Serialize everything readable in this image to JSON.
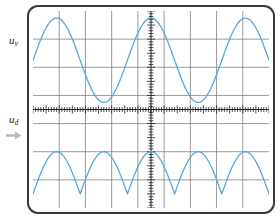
{
  "figure": {
    "kind": "oscilloscope-display"
  },
  "labels": {
    "channel_top": {
      "symbol": "u",
      "subscript": "v"
    },
    "channel_bottom": {
      "symbol": "u",
      "subscript": "d"
    },
    "arrow_icon": "right-arrow-icon"
  },
  "colors": {
    "trace": "#5ba7d4",
    "grid": "#6f6f74",
    "axis": "#231f20",
    "bezel": "#3a3a3c",
    "screen_bg": "#ffffff",
    "label_text": "#231f20",
    "arrow": "#b9b9bd"
  },
  "grid": {
    "columns": 9,
    "rows": 7,
    "horizontal_divisions": 9,
    "vertical_divisions": 7,
    "center_x_division": 4.5,
    "center_y_division": 3.5,
    "tick_count_horizontal": 90,
    "tick_count_vertical": 70,
    "show_grid": true
  },
  "chart_data": {
    "type": "line",
    "title": "",
    "xlabel": "",
    "ylabel": "",
    "xlim": [
      0,
      9
    ],
    "ylim": [
      -3.5,
      3.5
    ],
    "grid": true,
    "legend": "left-outside",
    "annotations": [
      {
        "text": "u_v",
        "role": "top-trace-label",
        "position": "left-outside-upper"
      },
      {
        "text": "u_d",
        "role": "bottom-trace-label",
        "position": "left-outside-lower"
      }
    ],
    "series": [
      {
        "name": "u_v",
        "label": "u_v",
        "description": "AC input sine wave, 2.5 periods across screen",
        "color": "#5ba7d4",
        "waveform": "sine",
        "periods": 2.5,
        "amplitude_divisions": 1.5,
        "baseline_division": 1.75,
        "phase_degrees": 0,
        "x": [
          0.0,
          0.45,
          0.9,
          1.35,
          1.8,
          2.25,
          2.7,
          3.15,
          3.6,
          4.05,
          4.5,
          4.95,
          5.4,
          5.85,
          6.3,
          6.75,
          7.2,
          7.65,
          8.1,
          8.55,
          9.0
        ],
        "y": [
          1.75,
          2.63,
          3.25,
          3.25,
          2.63,
          1.75,
          0.87,
          0.25,
          0.25,
          0.87,
          1.75,
          2.63,
          3.25,
          3.25,
          2.63,
          1.75,
          0.87,
          0.25,
          0.25,
          0.87,
          1.75
        ]
      },
      {
        "name": "u_d",
        "label": "u_d",
        "description": "Full-wave rectified output, 5 positive humps across screen",
        "color": "#5ba7d4",
        "waveform": "full-wave-rectified-sine",
        "humps": 5,
        "amplitude_divisions": 1.5,
        "baseline_division": -3.0,
        "x": [
          0.0,
          0.45,
          0.9,
          1.35,
          1.8,
          2.25,
          2.7,
          3.15,
          3.6,
          4.05,
          4.5,
          4.95,
          5.4,
          5.85,
          6.3,
          6.75,
          7.2,
          7.65,
          8.1,
          8.55,
          9.0
        ],
        "y": [
          -3.0,
          -2.12,
          -1.5,
          -2.12,
          -3.0,
          -2.12,
          -1.5,
          -2.12,
          -3.0,
          -2.12,
          -1.5,
          -2.12,
          -3.0,
          -2.12,
          -1.5,
          -2.12,
          -3.0,
          -2.12,
          -1.5,
          -2.12,
          -3.0
        ]
      }
    ]
  }
}
